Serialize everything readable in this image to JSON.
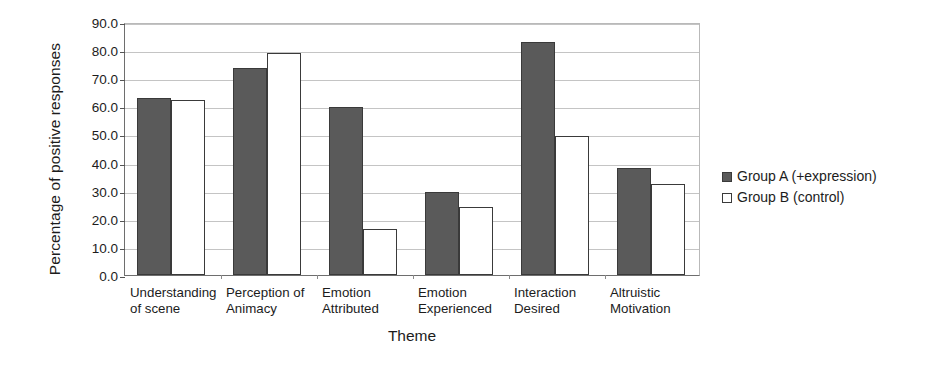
{
  "chart_data": {
    "type": "bar",
    "title": "",
    "xlabel": "Theme",
    "ylabel": "Percentage of positive responses",
    "ylim": [
      0,
      90
    ],
    "ytick_step": 10,
    "ytick_labels": [
      "0.0",
      "10.0",
      "20.0",
      "30.0",
      "40.0",
      "50.0",
      "60.0",
      "70.0",
      "80.0",
      "90.0"
    ],
    "grid": true,
    "legend_position": "right",
    "categories": [
      "Understanding\nof scene",
      "Perception of\nAnimacy",
      "Emotion\nAttributed",
      "Emotion\nExperienced",
      "Interaction\nDesired",
      "Altruistic\nMotivation"
    ],
    "series": [
      {
        "name": "Group A (+expression)",
        "color": "#5a5a5a",
        "values": [
          63.0,
          73.5,
          59.8,
          29.5,
          82.8,
          38.2
        ]
      },
      {
        "name": "Group B (control)",
        "color": "#ffffff",
        "values": [
          62.2,
          78.9,
          16.2,
          24.3,
          49.5,
          32.5
        ]
      }
    ]
  },
  "legend": {
    "items": [
      {
        "label": "Group A (+expression)",
        "swatch": "filled-square-icon"
      },
      {
        "label": "Group B (control)",
        "swatch": "outline-square-icon"
      }
    ]
  }
}
